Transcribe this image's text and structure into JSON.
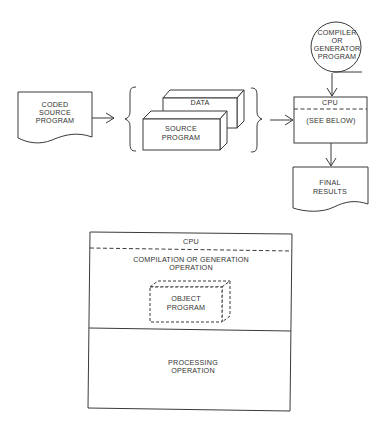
{
  "top_flow": {
    "coded_source": {
      "line1": "CODED",
      "line2": "SOURCE",
      "line3": "PROGRAM"
    },
    "data_box": {
      "label": "DATA"
    },
    "source_box": {
      "line1": "SOURCE",
      "line2": "PROGRAM"
    },
    "compiler": {
      "line1": "COMPILER",
      "line2": "OR",
      "line3": "GENERATOR",
      "line4": "PROGRAM"
    },
    "cpu_box": {
      "title": "CPU",
      "body": "(SEE BELOW)"
    },
    "final_results": {
      "line1": "FINAL",
      "line2": "RESULTS"
    }
  },
  "cpu_detail": {
    "title": "CPU",
    "compilation": {
      "line1": "COMPILATION OR GENERATION",
      "line2": "OPERATION"
    },
    "object_program": {
      "line1": "OBJECT",
      "line2": "PROGRAM"
    },
    "processing": {
      "line1": "PROCESSING",
      "line2": "OPERATION"
    }
  }
}
